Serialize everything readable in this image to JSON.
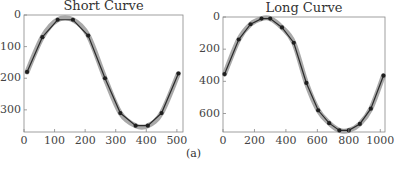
{
  "caption": "(a)",
  "chart_data": [
    {
      "type": "line",
      "title": "Short Curve",
      "xlabel": "",
      "ylabel": "",
      "xlim": [
        0,
        520
      ],
      "ylim": [
        370,
        0
      ],
      "y_inverted": true,
      "grid": false,
      "xticks": [
        0,
        100,
        200,
        300,
        400,
        500
      ],
      "yticks": [
        0,
        100,
        200,
        300
      ],
      "series": [
        {
          "name": "fit (gray thick)",
          "x": [
            10,
            60,
            110,
            160,
            210,
            265,
            315,
            365,
            405,
            450,
            505
          ],
          "y": [
            180,
            70,
            15,
            15,
            65,
            200,
            310,
            350,
            350,
            310,
            185
          ]
        },
        {
          "name": "points (dark markers)",
          "x": [
            10,
            60,
            110,
            160,
            210,
            265,
            315,
            365,
            405,
            450,
            505
          ],
          "y": [
            180,
            70,
            15,
            15,
            65,
            200,
            310,
            350,
            350,
            310,
            185
          ]
        }
      ]
    },
    {
      "type": "line",
      "title": "Long Curve",
      "xlabel": "",
      "ylabel": "",
      "xlim": [
        0,
        1030
      ],
      "ylim": [
        715,
        0
      ],
      "y_inverted": true,
      "grid": false,
      "xticks": [
        0,
        200,
        400,
        600,
        800,
        1000
      ],
      "yticks": [
        0,
        200,
        400,
        600
      ],
      "series": [
        {
          "name": "fit (gray thick)",
          "x": [
            10,
            100,
            175,
            245,
            300,
            375,
            450,
            530,
            605,
            675,
            740,
            800,
            870,
            940,
            1020
          ],
          "y": [
            355,
            140,
            45,
            10,
            10,
            65,
            160,
            410,
            580,
            660,
            705,
            705,
            665,
            570,
            365
          ]
        },
        {
          "name": "points (dark markers)",
          "x": [
            10,
            100,
            175,
            245,
            300,
            375,
            450,
            530,
            605,
            675,
            740,
            800,
            870,
            940,
            1020
          ],
          "y": [
            355,
            140,
            45,
            10,
            10,
            65,
            160,
            410,
            580,
            660,
            705,
            705,
            665,
            570,
            365
          ]
        }
      ]
    }
  ],
  "layout": {
    "panels": [
      {
        "left": 24,
        "top": 15,
        "width": 159,
        "height": 117
      },
      {
        "left": 223,
        "top": 17,
        "width": 162,
        "height": 115
      }
    ],
    "colors": {
      "fit": "#9a9a9a",
      "line": "#2b2b2b",
      "marker": "#1f1f1f",
      "frame": "#888888"
    }
  }
}
